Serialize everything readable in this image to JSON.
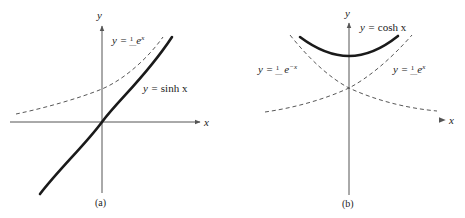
{
  "figure": {
    "panels": [
      {
        "id": "a",
        "caption": "(a)",
        "x_axis_label": "x",
        "y_axis_label": "y",
        "curves": [
          {
            "name": "sinh",
            "label_lhs": "y = ",
            "label_rhs": "sinh x",
            "style": "solid"
          },
          {
            "name": "half-exp",
            "label_lhs": "y = ",
            "label_frac_num": "1",
            "label_frac_den": "2",
            "label_rhs": "e",
            "label_sup": "x",
            "style": "dashed"
          }
        ]
      },
      {
        "id": "b",
        "caption": "(b)",
        "x_axis_label": "x",
        "y_axis_label": "y",
        "curves": [
          {
            "name": "cosh",
            "label_lhs": "y = ",
            "label_rhs": "cosh x",
            "style": "solid"
          },
          {
            "name": "half-exp-neg",
            "label_lhs": "y = ",
            "label_frac_num": "1",
            "label_frac_den": "2",
            "label_rhs": "e",
            "label_sup": "−x",
            "style": "dashed"
          },
          {
            "name": "half-exp",
            "label_lhs": "y = ",
            "label_frac_num": "1",
            "label_frac_den": "2",
            "label_rhs": "e",
            "label_sup": "x",
            "style": "dashed"
          }
        ]
      }
    ]
  }
}
